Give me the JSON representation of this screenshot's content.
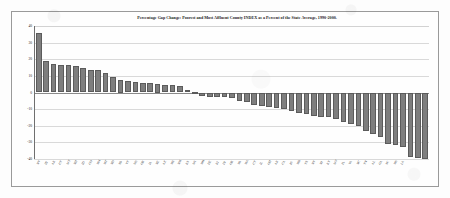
{
  "chart_data": {
    "type": "bar",
    "title": "Percentage Gap Change: Poorest and Most Affluent County INDEX as a Percent of the State Average, 1990-2000.",
    "xlabel": "",
    "ylabel": "",
    "ylim": [
      -40,
      40
    ],
    "yticks": [
      40,
      30,
      20,
      10,
      0,
      -10,
      -20,
      -30,
      -40
    ],
    "ytick_labels": [
      "40",
      "30",
      "20",
      "10",
      "0",
      "-10",
      "-20",
      "-30",
      "-40"
    ],
    "grid": true,
    "legend": false,
    "orientation": "vertical",
    "bar_color": "#7e7e7e",
    "categories": [
      "NV",
      "HI",
      "AK",
      "UT",
      "WY",
      "NH",
      "ID",
      "CO",
      "MN",
      "MT",
      "ND",
      "SD",
      "VT",
      "WA",
      "OR",
      "IA",
      "NE",
      "AZ",
      "ME",
      "NM",
      "KS",
      "WI",
      "MO",
      "DE",
      "RI",
      "IN",
      "OK",
      "MI",
      "MA",
      "CT",
      "IL",
      "OH",
      "AR",
      "CA",
      "PA",
      "MD",
      "TX",
      "NY",
      "NJ",
      "KY",
      "WV",
      "FL",
      "VA",
      "NC",
      "TN",
      "AL",
      "GA",
      "SC",
      "MS",
      "LA"
    ],
    "values": [
      36,
      19,
      17,
      16.5,
      16.5,
      16,
      14.5,
      13.5,
      13.5,
      11.5,
      9.5,
      7.5,
      7,
      6.5,
      6,
      5.5,
      5,
      4.5,
      4.5,
      4,
      1.5,
      0.5,
      -2,
      -2.5,
      -2.5,
      -3,
      -3.5,
      -5,
      -5.5,
      -7.5,
      -8,
      -9,
      -9.5,
      -10,
      -11,
      -12.5,
      -13,
      -14,
      -14.5,
      -15,
      -16,
      -18,
      -19,
      -20,
      -23,
      -25,
      -26.5,
      -31,
      -31.5,
      -33
    ],
    "values_tail": [
      -39,
      -39.5,
      -40
    ]
  }
}
